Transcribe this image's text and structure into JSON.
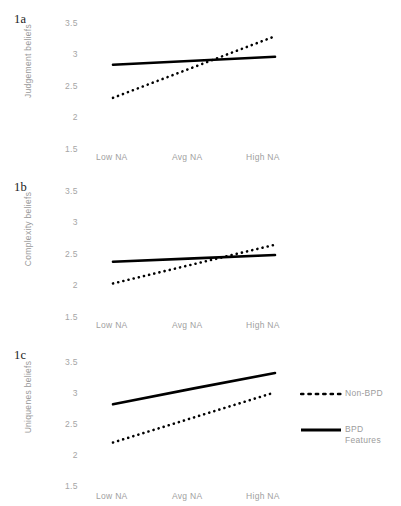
{
  "figure": {
    "panels": [
      {
        "id": "1a",
        "label": "1a",
        "ylabel": "Judgement  beliefs",
        "yticks": [
          "3.5",
          "3",
          "2.5",
          "2",
          "1.5"
        ],
        "xticks": [
          "Low NA",
          "Avg NA",
          "High NA"
        ]
      },
      {
        "id": "1b",
        "label": "1b",
        "ylabel": "Complexity beliefs",
        "yticks": [
          "3.5",
          "3",
          "2.5",
          "2",
          "1.5"
        ],
        "xticks": [
          "Low NA",
          "Avg NA",
          "High NA"
        ]
      },
      {
        "id": "1c",
        "label": "1c",
        "ylabel": "Uniquenes beliefs",
        "yticks": [
          "3.5",
          "3",
          "2.5",
          "2",
          "1.5"
        ],
        "xticks": [
          "Low NA",
          "Avg NA",
          "High NA"
        ]
      }
    ],
    "legend": {
      "items": [
        {
          "label": "Non-BPD",
          "style": "dotted"
        },
        {
          "label": "BPD Features",
          "style": "solid"
        }
      ]
    },
    "colors": {
      "line": "#000000",
      "tick_text": "#a5a5a5",
      "axis_title": "#9a9a9a",
      "panel_label": "#1a1a1a",
      "background": "#ffffff"
    }
  },
  "chart_data": [
    {
      "type": "line",
      "id": "1a",
      "title": "1a",
      "xlabel": "",
      "ylabel": "Judgement  beliefs",
      "categories": [
        "Low NA",
        "Avg NA",
        "High NA"
      ],
      "ylim": [
        1.5,
        3.5
      ],
      "yticks": [
        1.5,
        2.0,
        2.5,
        3.0,
        3.5
      ],
      "grid": false,
      "legend_position": "right",
      "series": [
        {
          "name": "Non-BPD",
          "style": "dotted",
          "values": [
            2.1,
            2.64,
            3.18
          ]
        },
        {
          "name": "BPD Features",
          "style": "solid",
          "values": [
            2.68,
            2.75,
            2.82
          ]
        }
      ]
    },
    {
      "type": "line",
      "id": "1b",
      "title": "1b",
      "xlabel": "",
      "ylabel": "Complexity beliefs",
      "categories": [
        "Low NA",
        "Avg NA",
        "High NA"
      ],
      "ylim": [
        1.5,
        3.5
      ],
      "yticks": [
        1.5,
        2.0,
        2.5,
        3.0,
        3.5
      ],
      "grid": false,
      "legend_position": "right",
      "series": [
        {
          "name": "Non-BPD",
          "style": "dotted",
          "values": [
            1.79,
            2.13,
            2.47
          ]
        },
        {
          "name": "BPD Features",
          "style": "solid",
          "values": [
            2.17,
            2.23,
            2.29
          ]
        }
      ]
    },
    {
      "type": "line",
      "id": "1c",
      "title": "1c",
      "xlabel": "",
      "ylabel": "Uniquenes beliefs",
      "categories": [
        "Low NA",
        "Avg NA",
        "High NA"
      ],
      "ylim": [
        1.5,
        3.5
      ],
      "yticks": [
        1.5,
        2.0,
        2.5,
        3.0,
        3.5
      ],
      "grid": false,
      "legend_position": "right",
      "series": [
        {
          "name": "Non-BPD",
          "style": "dotted",
          "values": [
            2.0,
            2.44,
            2.88
          ]
        },
        {
          "name": "BPD Features",
          "style": "solid",
          "values": [
            2.67,
            2.95,
            3.22
          ]
        }
      ]
    }
  ]
}
